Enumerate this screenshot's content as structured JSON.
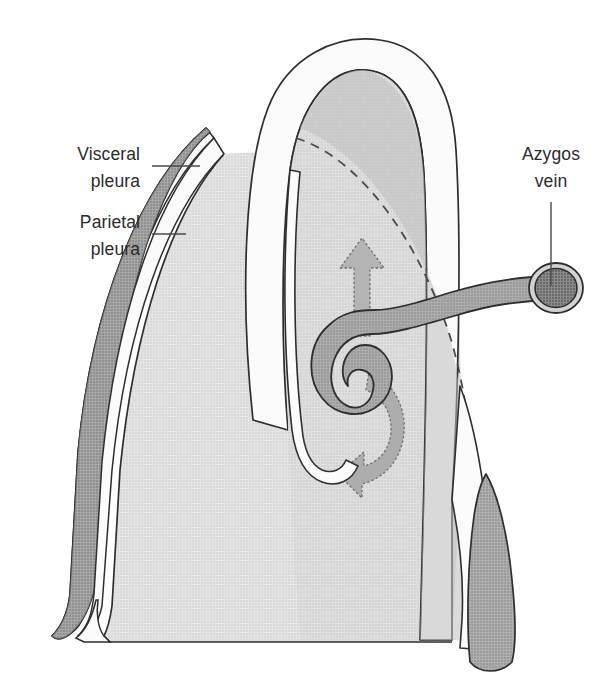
{
  "figure": {
    "type": "anatomical-line-illustration",
    "background_color": "#ffffff"
  },
  "labels": [
    {
      "id": "visceral-pleura",
      "line1": "Visceral",
      "line2": "pleura",
      "text_anchor_x": 140,
      "text_y1": 160,
      "text_y2": 187,
      "leader": {
        "x1": 152,
        "y1": 166,
        "x2": 198,
        "y2": 166
      }
    },
    {
      "id": "parietal-pleura",
      "line1": "Parietal",
      "line2": "pleura",
      "text_anchor_x": 140,
      "text_y1": 228,
      "text_y2": 255,
      "leader": {
        "x1": 152,
        "y1": 234,
        "x2": 185,
        "y2": 234
      }
    },
    {
      "id": "azygos-vein",
      "line1": "Azygos",
      "line2": "vein",
      "text_anchor_x": 551,
      "text_y1": 160,
      "text_y2": 187,
      "leader": {
        "x1": 551,
        "y1": 202,
        "x2": 551,
        "y2": 288
      }
    }
  ],
  "colors": {
    "lung_fill": "#d9d9d9",
    "mediastinum_fill": "#d2d2d2",
    "mediastinum_shadow": "#c2c2c2",
    "vessel_fill": "#9b9b9b",
    "vessel_dark": "#8d8d8d",
    "vessel_lumen": "#6d6d6d",
    "vessel_ring": "#cfcfcf",
    "pleura_gap": "#f7f7f7",
    "pleura_back": "#8e8e8e",
    "arrow_fill": "#b0b0b0",
    "outline": "#2e2e2e",
    "leader": "#4a4a4a",
    "text": "#2b2b2b",
    "page": "#ffffff"
  },
  "structures": [
    {
      "id": "lung",
      "name": "lung (right lung, lateral view)",
      "fill_key": "lung_fill"
    },
    {
      "id": "parietal-pleura-layer",
      "name": "parietal pleura sheet",
      "fill_key": "pleura_gap"
    },
    {
      "id": "parietal-pleura-flap",
      "name": "peeled parietal pleura flap",
      "fill_key": "pleura_back"
    },
    {
      "id": "visceral-pleura-layer",
      "name": "visceral pleura line",
      "fill_key": "outline"
    },
    {
      "id": "mediastinum",
      "name": "mediastinal dome",
      "fill_key": "mediastinum_fill"
    },
    {
      "id": "azygos-vein-arch",
      "name": "azygos vein arch",
      "fill_key": "vessel_fill"
    },
    {
      "id": "azygos-vein-cut-end",
      "name": "azygos vein cut cross-section",
      "fill_key": "vessel_lumen"
    },
    {
      "id": "azygos-vein-descending",
      "name": "descending azygos vein",
      "fill_key": "vessel_dark"
    },
    {
      "id": "dashed-contour",
      "name": "hidden contour dashed line",
      "fill_key": "outline"
    },
    {
      "id": "arrow-up",
      "name": "upward movement arrow",
      "fill_key": "arrow_fill"
    },
    {
      "id": "arrow-curved",
      "name": "curved movement arrow around vein arch",
      "fill_key": "arrow_fill"
    }
  ]
}
